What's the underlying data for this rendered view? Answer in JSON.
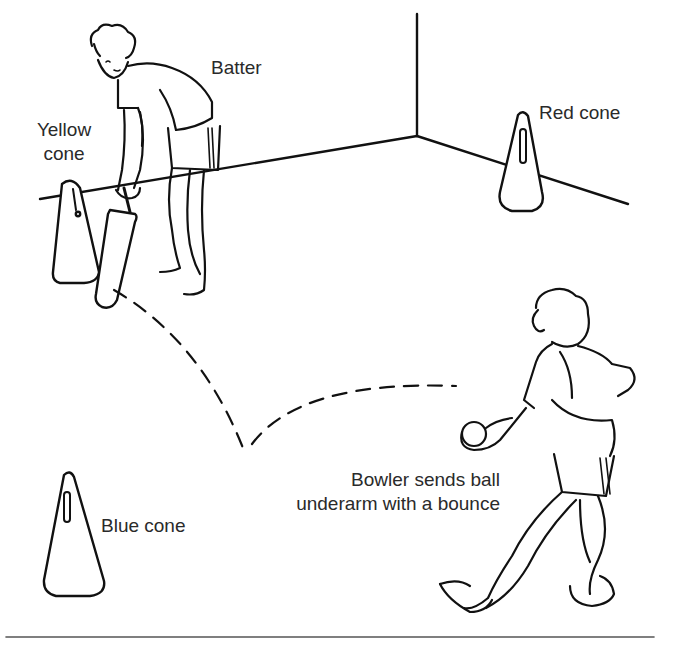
{
  "diagram": {
    "title": "",
    "labels": {
      "batter": "Batter",
      "yellow_cone": [
        "Yellow",
        "cone"
      ],
      "red_cone": "Red cone",
      "blue_cone": "Blue cone",
      "bowler": [
        "Bowler sends ball",
        "underarm with a bounce"
      ]
    },
    "colors": {
      "line": "#111111",
      "text": "#2a2a2a",
      "background": "#ffffff",
      "rule": "#555555"
    }
  }
}
